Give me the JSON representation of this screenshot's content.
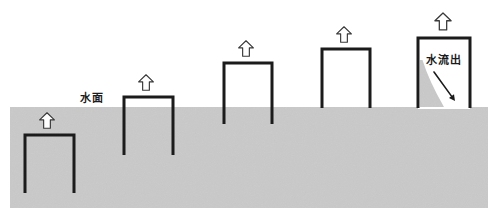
{
  "diagram": {
    "canvas": {
      "width": 496,
      "height": 223,
      "background": "#ffffff"
    },
    "colors": {
      "water_fill": "#c9c9c9",
      "water_fill_alt": "#cccccc",
      "wall_stroke": "#1b1b1b",
      "arrow_fill": "#ffffff",
      "arrow_stroke": "#3a3a3a",
      "text": "#1b1b1b",
      "drained_interior": "#ffffff",
      "residual_water": "#c9c9c9"
    },
    "water": {
      "surface_label": "水面",
      "surface_label_x": 92,
      "surface_label_y": 102,
      "surface_y": 107,
      "bottom_y": 208,
      "left_x": 10,
      "right_x": 488
    },
    "outflow": {
      "label": "水流出",
      "label_x": 444,
      "label_y": 64,
      "arrow_from_x": 434,
      "arrow_from_y": 72,
      "arrow_to_x": 455,
      "arrow_to_y": 101
    },
    "containers": [
      {
        "id": "container-1",
        "name": "container-submerged-lowest",
        "left_x": 25,
        "right_x": 74,
        "top_y": 135,
        "bottom_y": 193,
        "interior": "water",
        "arrow_cx": 47,
        "arrow_top_y": 110,
        "arrow_bottom_y": 131
      },
      {
        "id": "container-2",
        "name": "container-rising-second",
        "left_x": 124,
        "right_x": 173,
        "top_y": 97,
        "bottom_y": 155,
        "interior": "water",
        "arrow_cx": 146,
        "arrow_top_y": 72,
        "arrow_bottom_y": 93
      },
      {
        "id": "container-3",
        "name": "container-rising-third",
        "left_x": 224,
        "right_x": 272,
        "top_y": 63,
        "bottom_y": 124,
        "interior": "water",
        "arrow_cx": 246,
        "arrow_top_y": 38,
        "arrow_bottom_y": 59
      },
      {
        "id": "container-4",
        "name": "container-rising-fourth",
        "left_x": 322,
        "right_x": 370,
        "top_y": 49,
        "bottom_y": 108,
        "interior": "water",
        "arrow_cx": 344,
        "arrow_top_y": 24,
        "arrow_bottom_y": 45
      },
      {
        "id": "container-5",
        "name": "container-drained-highest",
        "left_x": 418,
        "right_x": 470,
        "top_y": 38,
        "bottom_y": 108,
        "interior": "drained",
        "arrow_cx": 443,
        "arrow_top_y": 10,
        "arrow_bottom_y": 33
      }
    ]
  }
}
